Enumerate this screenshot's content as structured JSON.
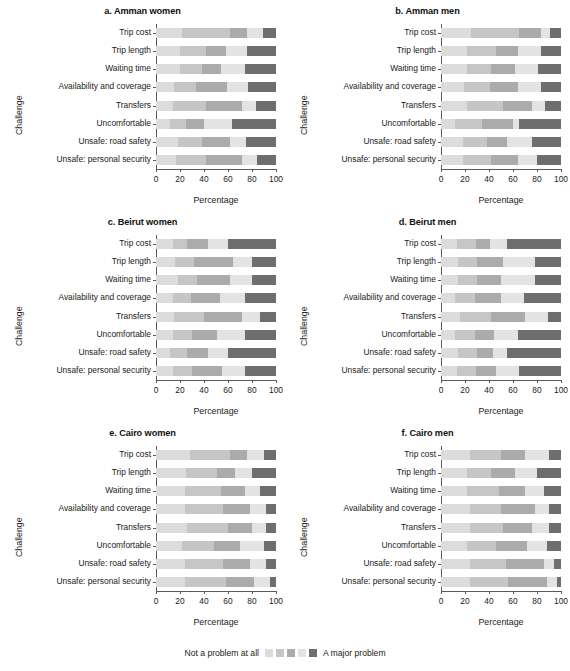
{
  "figure": {
    "axis_title_x": "Percentage",
    "axis_title_y": "Challenge",
    "tick_labels": [
      "0",
      "20",
      "40",
      "60",
      "80",
      "100"
    ]
  },
  "legend": {
    "left_label": "Not a problem at all",
    "right_label": "A major problem",
    "colors": [
      "#dcdcdc",
      "#c6c6c6",
      "#ababab",
      "#e3e3e3",
      "#6e6e6e"
    ]
  },
  "chart_data": {
    "type": "bar",
    "subtype": "stacked-horizontal-likert",
    "xlabel": "Percentage",
    "ylabel": "Challenge",
    "xlim": [
      0,
      100
    ],
    "xticks": [
      0,
      20,
      40,
      60,
      80,
      100
    ],
    "grid": false,
    "legend_position": "bottom-center",
    "categories": [
      "Trip cost",
      "Trip length",
      "Waiting time",
      "Availability and coverage",
      "Transfers",
      "Uncomfortable",
      "Unsafe: road safety",
      "Unsafe: personal security"
    ],
    "series": [
      {
        "name": "Not a problem at all",
        "color": "#dcdcdc"
      },
      {
        "name": "Minor problem",
        "color": "#c6c6c6"
      },
      {
        "name": "Moderate problem",
        "color": "#ababab"
      },
      {
        "name": "Problem",
        "color": "#e3e3e3"
      },
      {
        "name": "A major problem",
        "color": "#6e6e6e"
      }
    ],
    "panels": [
      {
        "id": "a",
        "label": "a. Amman women",
        "values": [
          [
            22,
            40,
            14,
            13,
            11
          ],
          [
            20,
            22,
            16,
            18,
            24
          ],
          [
            20,
            18,
            16,
            20,
            26
          ],
          [
            15,
            18,
            26,
            18,
            23
          ],
          [
            14,
            28,
            30,
            11,
            17
          ],
          [
            12,
            13,
            15,
            23,
            37
          ],
          [
            18,
            20,
            24,
            13,
            25
          ],
          [
            17,
            25,
            30,
            12,
            16
          ]
        ]
      },
      {
        "id": "b",
        "label": "b. Amman men",
        "values": [
          [
            25,
            40,
            18,
            8,
            9
          ],
          [
            22,
            24,
            18,
            19,
            17
          ],
          [
            22,
            20,
            20,
            19,
            19
          ],
          [
            19,
            22,
            23,
            19,
            17
          ],
          [
            22,
            30,
            24,
            11,
            13
          ],
          [
            12,
            22,
            26,
            5,
            35
          ],
          [
            18,
            20,
            17,
            21,
            24
          ],
          [
            18,
            24,
            22,
            16,
            20
          ]
        ]
      },
      {
        "id": "c",
        "label": "c. Beirut women",
        "values": [
          [
            14,
            12,
            17,
            17,
            40
          ],
          [
            16,
            16,
            32,
            16,
            20
          ],
          [
            18,
            16,
            28,
            18,
            20
          ],
          [
            14,
            15,
            24,
            21,
            26
          ],
          [
            15,
            25,
            32,
            15,
            13
          ],
          [
            14,
            16,
            21,
            23,
            26
          ],
          [
            12,
            14,
            17,
            17,
            40
          ],
          [
            14,
            16,
            25,
            19,
            26
          ]
        ]
      },
      {
        "id": "d",
        "label": "d. Beirut men",
        "values": [
          [
            13,
            16,
            12,
            14,
            45
          ],
          [
            14,
            16,
            22,
            26,
            22
          ],
          [
            14,
            16,
            20,
            28,
            22
          ],
          [
            12,
            16,
            22,
            19,
            31
          ],
          [
            16,
            26,
            28,
            19,
            11
          ],
          [
            12,
            16,
            16,
            20,
            36
          ],
          [
            14,
            16,
            13,
            12,
            45
          ],
          [
            13,
            16,
            17,
            19,
            35
          ]
        ]
      },
      {
        "id": "e",
        "label": "e. Cairo women",
        "values": [
          [
            28,
            34,
            14,
            14,
            10
          ],
          [
            25,
            26,
            15,
            14,
            20
          ],
          [
            24,
            30,
            20,
            13,
            13
          ],
          [
            24,
            32,
            22,
            14,
            8
          ],
          [
            26,
            34,
            20,
            12,
            8
          ],
          [
            22,
            26,
            22,
            20,
            10
          ],
          [
            24,
            32,
            22,
            14,
            8
          ],
          [
            24,
            34,
            24,
            13,
            5
          ]
        ]
      },
      {
        "id": "f",
        "label": "f. Cairo men",
        "values": [
          [
            24,
            26,
            20,
            20,
            10
          ],
          [
            22,
            20,
            20,
            18,
            20
          ],
          [
            22,
            26,
            22,
            16,
            14
          ],
          [
            24,
            26,
            28,
            12,
            10
          ],
          [
            24,
            28,
            24,
            14,
            10
          ],
          [
            22,
            24,
            26,
            16,
            12
          ],
          [
            24,
            30,
            32,
            8,
            6
          ],
          [
            24,
            32,
            32,
            9,
            3
          ]
        ]
      }
    ]
  }
}
